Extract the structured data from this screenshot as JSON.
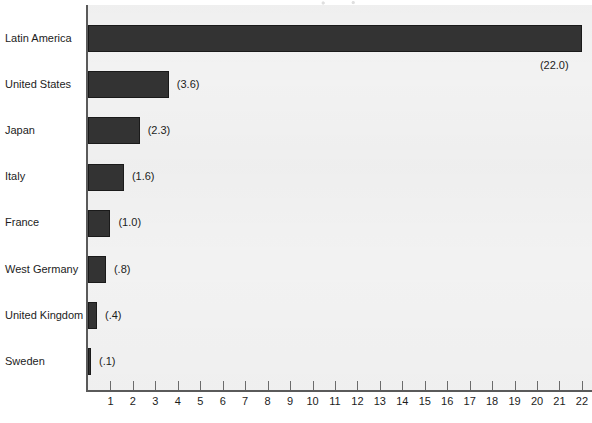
{
  "chart_data": {
    "type": "bar",
    "orientation": "horizontal",
    "title": "",
    "subtitle": "",
    "xlabel": "",
    "ylabel": "",
    "categories": [
      "Latin America",
      "United States",
      "Japan",
      "Italy",
      "France",
      "West Germany",
      "United Kingdom",
      "Sweden"
    ],
    "values": [
      22.0,
      3.6,
      2.3,
      1.6,
      1.0,
      0.8,
      0.4,
      0.1
    ],
    "value_labels": [
      "(22.0)",
      "(3.6)",
      "(2.3)",
      "(1.6)",
      "(1.0)",
      "(.8)",
      "(.4)",
      "(.1)"
    ],
    "xlim": [
      0,
      22.4
    ],
    "xticks": [
      1,
      2,
      3,
      4,
      5,
      6,
      7,
      8,
      9,
      10,
      11,
      12,
      13,
      14,
      15,
      16,
      17,
      18,
      19,
      20,
      21,
      22
    ],
    "xtick_labels": [
      "1",
      "2",
      "3",
      "4",
      "5",
      "6",
      "7",
      "8",
      "9",
      "10",
      "11",
      "12",
      "13",
      "14",
      "15",
      "16",
      "17",
      "18",
      "19",
      "20",
      "21",
      "22"
    ],
    "grid": false,
    "legend": null,
    "legend_position": "none",
    "colors": {
      "bar_fill": "#333333",
      "bar_edge": "#1a1a1a",
      "plot_background": "#f2f2f2",
      "page_background": "#ffffff",
      "axis_line": "#5a5a5a",
      "text": "#1c1c1c"
    }
  }
}
